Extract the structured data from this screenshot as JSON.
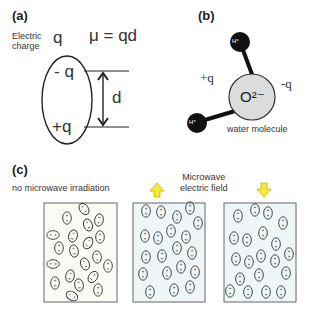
{
  "panel_a": {
    "label": "(a)",
    "electric_charge_label_line1": "Electric",
    "electric_charge_label_line2": "charge",
    "q_symbol": "q",
    "formula": "μ = qd",
    "neg_charge": "- q",
    "pos_charge": "+q",
    "distance_label": "d"
  },
  "panel_b": {
    "label": "(b)",
    "pos_charge": "+q",
    "neg_charge": "-q",
    "oxygen_label": "O²⁻",
    "hydrogen_label": "H⁺",
    "caption": "water molecule",
    "colors": {
      "oxygen_fill": "#dcdcdc",
      "hydrogen_fill": "#111111"
    }
  },
  "panel_c": {
    "label": "(c)",
    "no_irradiation_label": "no microwave irradiation",
    "field_label_line1": "Microwave",
    "field_label_line2": "electric field",
    "arrow_up": "arrow-up",
    "arrow_down": "arrow-down",
    "colors": {
      "arrow_fill": "#f5e93a",
      "arrow_stroke": "#c9b400",
      "panel_random_bg": "#fbfbf6",
      "panel_field_bg": "#eef6f8",
      "panel_border": "#666666"
    },
    "boxes": [
      {
        "name": "random-orientation",
        "state": "no field"
      },
      {
        "name": "aligned-up",
        "state": "field up, + on top"
      },
      {
        "name": "aligned-down",
        "state": "field down, - on top"
      }
    ]
  }
}
